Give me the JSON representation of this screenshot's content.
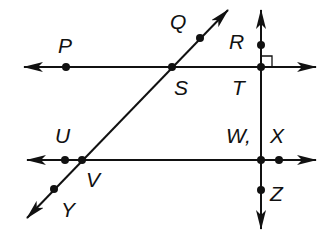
{
  "diagram": {
    "type": "geometry-lines",
    "color": "#111111",
    "lines": [
      {
        "name": "line-PT",
        "description": "upper horizontal line through P, S, T",
        "from": [
          24,
          67
        ],
        "to": [
          316,
          67
        ],
        "arrows": "both"
      },
      {
        "name": "line-UX",
        "description": "lower horizontal line through U, V, W, X",
        "from": [
          27,
          160
        ],
        "to": [
          316,
          160
        ],
        "arrows": "both"
      },
      {
        "name": "line-RZ",
        "description": "vertical line through R, T, W, Z",
        "from": [
          261,
          10
        ],
        "to": [
          261,
          229
        ],
        "arrows": "both"
      },
      {
        "name": "line-QY",
        "description": "transversal through Q, S, V, Y",
        "from": [
          228,
          10
        ],
        "to": [
          27,
          218
        ],
        "arrows": "both"
      }
    ],
    "points": [
      {
        "label": "P",
        "x": 66,
        "y": 67,
        "lx": 58,
        "ly": 53
      },
      {
        "label": "Q",
        "x": 200,
        "y": 38,
        "lx": 170,
        "ly": 29
      },
      {
        "label": "R",
        "x": 261,
        "y": 45,
        "lx": 229,
        "ly": 49
      },
      {
        "label": "S",
        "x": 172,
        "y": 67,
        "lx": 174,
        "ly": 95
      },
      {
        "label": "T",
        "x": 261,
        "y": 67,
        "lx": 232,
        "ly": 95
      },
      {
        "label": "U",
        "x": 65,
        "y": 160,
        "lx": 55,
        "ly": 143
      },
      {
        "label": "V",
        "x": 82,
        "y": 160,
        "lx": 86,
        "ly": 187
      },
      {
        "label": "W",
        "x": 261,
        "y": 160,
        "lx": 226,
        "ly": 143
      },
      {
        "label": "X",
        "x": 279,
        "y": 160,
        "lx": 270,
        "ly": 143
      },
      {
        "label": "Y",
        "x": 54,
        "y": 189,
        "lx": 61,
        "ly": 217
      },
      {
        "label": "Z",
        "x": 261,
        "y": 190,
        "lx": 270,
        "ly": 201
      }
    ],
    "annotations": [
      {
        "type": "right-angle-marker",
        "at": "T",
        "quadrant": "upper-right",
        "size": 11
      }
    ],
    "w_label_comma": ","
  }
}
